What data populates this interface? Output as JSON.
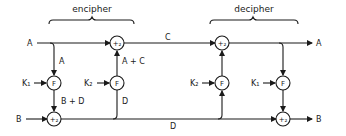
{
  "diagram": {
    "sections": [
      {
        "id": "encipher",
        "label": "encipher"
      },
      {
        "id": "decipher",
        "label": "decipher"
      }
    ],
    "inputs": {
      "a": "A",
      "b": "B"
    },
    "outputs": {
      "a": "A",
      "b": "B"
    },
    "keys": {
      "k1": "K₁",
      "k2": "K₂"
    },
    "node_labels": {
      "f": "F",
      "adder": "+₂"
    },
    "edge_labels": {
      "left_branch_a": "A",
      "b_plus_d": "B + D",
      "a_plus_c": "A + C",
      "middle_d": "D",
      "top_c": "C",
      "bottom_d": "D"
    }
  }
}
